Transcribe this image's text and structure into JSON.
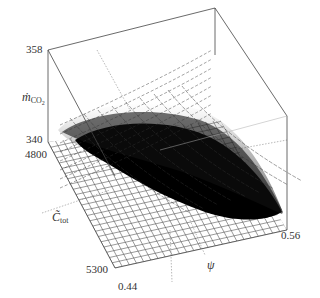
{
  "chart_data": {
    "type": "surface3d",
    "title": "",
    "axes": {
      "z": {
        "label": "ṁCO2",
        "label_main": "ṁ",
        "label_sub": "CO",
        "label_sub2": "2",
        "ticks": [
          "340",
          "358"
        ],
        "range": [
          340,
          358
        ]
      },
      "y": {
        "label": "C̃tot",
        "label_main": "C̃",
        "label_sub": "tot",
        "ticks": [
          "4800",
          "5300"
        ],
        "range": [
          4800,
          5300
        ]
      },
      "x": {
        "label": "ψ",
        "ticks": [
          "0.44",
          "0.56"
        ],
        "range": [
          0.44,
          0.56
        ]
      }
    },
    "grid": true,
    "colors": {
      "frame": "#444444",
      "cloud": "#000000",
      "mesh": "#555555",
      "floor_grid": "#666666"
    }
  },
  "labels": {
    "z_top": "358",
    "z_bottom": "340",
    "z_name": "ṁ",
    "z_sub": "CO",
    "z_sub2": "2",
    "y_top": "4800",
    "y_bottom": "5300",
    "y_name": "C̃",
    "y_sub": "tot",
    "x_left": "0.44",
    "x_right": "0.56",
    "x_name": "ψ"
  }
}
